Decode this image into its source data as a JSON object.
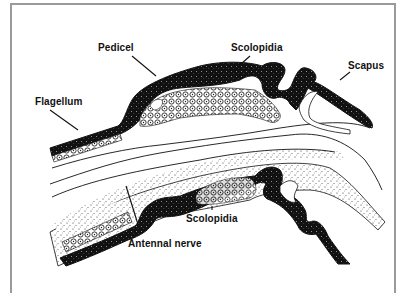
{
  "diagram": {
    "labels": {
      "pedicel": "Pedicel",
      "scolopidia_top": "Scolopidia",
      "scapus": "Scapus",
      "flagellum": "Flagellum",
      "scolopidia_bottom": "Scolopidia",
      "antennal_nerve": "Antennal nerve"
    },
    "colors": {
      "ink": "#111111",
      "frame": "#9a9a9a",
      "background": "#ffffff"
    }
  }
}
